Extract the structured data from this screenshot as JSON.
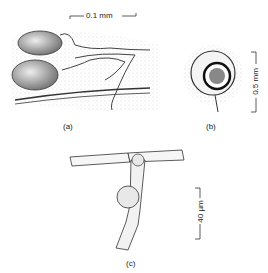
{
  "panels": [
    {
      "id": "a",
      "label": "(a)",
      "scale_bar": "0.1 mm",
      "orientation": "horizontal"
    },
    {
      "id": "b",
      "label": "(b)",
      "scale_bar": "0.5 mm",
      "orientation": "vertical"
    },
    {
      "id": "c",
      "label": "(c)",
      "scale_bar": "40 µm",
      "orientation": "vertical"
    }
  ]
}
